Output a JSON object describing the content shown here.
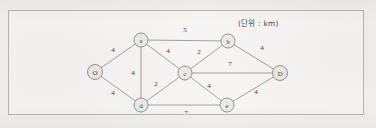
{
  "figure": {
    "caption": "(단위 : km)",
    "caption_x": 238,
    "caption_y": 17
  },
  "chart_data": {
    "type": "diagram",
    "diagram_kind": "weighted-undirected-graph",
    "title": "",
    "unit_note": "(단위 : km)",
    "unit": "km",
    "nodes": [
      {
        "id": "O",
        "label": "O",
        "x": 95,
        "y": 72,
        "r": 7.5
      },
      {
        "id": "a",
        "label": "a",
        "x": 141,
        "y": 40,
        "r": 7.0
      },
      {
        "id": "b",
        "label": "b",
        "x": 228,
        "y": 41,
        "r": 7.0
      },
      {
        "id": "c",
        "label": "c",
        "x": 185,
        "y": 73,
        "r": 7.0
      },
      {
        "id": "d",
        "label": "d",
        "x": 141,
        "y": 105,
        "r": 7.0
      },
      {
        "id": "e",
        "label": "e",
        "x": 227,
        "y": 105,
        "r": 7.0
      },
      {
        "id": "D",
        "label": "D",
        "x": 280,
        "y": 73,
        "r": 7.5
      }
    ],
    "edges": [
      {
        "from": "O",
        "to": "a",
        "weight": 4,
        "label": "4",
        "lx": 113,
        "ly": 50
      },
      {
        "from": "O",
        "to": "d",
        "weight": 4,
        "label": "4",
        "lx": 113,
        "ly": 93
      },
      {
        "from": "a",
        "to": "b",
        "weight": 5,
        "label": "5",
        "lx": 185,
        "ly": 30
      },
      {
        "from": "a",
        "to": "c",
        "weight": 4,
        "label": "4",
        "lx": 168,
        "ly": 51
      },
      {
        "from": "a",
        "to": "d",
        "weight": 4,
        "label": "4",
        "lx": 133,
        "ly": 73
      },
      {
        "from": "c",
        "to": "b",
        "weight": 2,
        "label": "2",
        "lx": 199,
        "ly": 52
      },
      {
        "from": "c",
        "to": "d",
        "weight": 2,
        "label": "2",
        "lx": 156,
        "ly": 84
      },
      {
        "from": "c",
        "to": "D",
        "weight": 7,
        "label": "7",
        "lx": 230,
        "ly": 64
      },
      {
        "from": "c",
        "to": "e",
        "weight": 4,
        "label": "4",
        "lx": 209,
        "ly": 86
      },
      {
        "from": "b",
        "to": "D",
        "weight": 4,
        "label": "4",
        "lx": 262,
        "ly": 48
      },
      {
        "from": "e",
        "to": "D",
        "weight": 4,
        "label": "4",
        "lx": 256,
        "ly": 92
      },
      {
        "from": "d",
        "to": "e",
        "weight": 7,
        "label": "7",
        "lx": 186,
        "ly": 113
      }
    ],
    "colors": {
      "edge": "#8d8b87",
      "node_fill": "#eceae6",
      "node_stroke": "#8b8985",
      "text": "#3f3d3a",
      "paper": "#f3f2ef",
      "frame": "#b9b7b3"
    }
  }
}
